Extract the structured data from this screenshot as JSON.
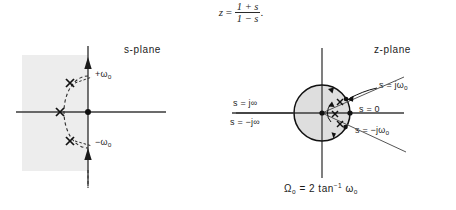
{
  "figure": {
    "title_equation": {
      "lhs": "z",
      "eq": "=",
      "numerator": "1 + s",
      "denominator": "1 − s",
      "period": "."
    },
    "left_panel": {
      "name": "s-plane",
      "label": "s-plane",
      "axes": {
        "horizontal": "real axis",
        "vertical": "imaginary axis"
      },
      "shaded_region": "left half plane",
      "shade_color": "#ececec",
      "origin_marker": "filled-dot",
      "poles": [
        {
          "marker": "x",
          "label": "+ω₀"
        },
        {
          "marker": "x",
          "label": ""
        },
        {
          "marker": "x",
          "label": "−ω₀"
        }
      ],
      "annotations": [
        {
          "text_main": "+ω",
          "text_sub": "o"
        },
        {
          "text_main": "−ω",
          "text_sub": "o"
        }
      ],
      "dashed_arc": "semicircle through poles"
    },
    "right_panel": {
      "name": "z-plane",
      "label": "z-plane",
      "unit_circle": "shaded unit disk",
      "shade_color": "#dcdcdc",
      "angle_label_main": "Ω",
      "angle_label_sub": "o",
      "labels": [
        {
          "id": "s-j-infinity",
          "text": "s = j∞"
        },
        {
          "id": "s-minus-j-infinity",
          "text": "s = −j∞"
        },
        {
          "id": "s-zero",
          "text": "s = 0"
        },
        {
          "id": "s-j-omega-zero",
          "text_main": "s = jω",
          "text_sub": "o"
        },
        {
          "id": "s-minus-j-omega-zero",
          "text_main": "s = −jω",
          "text_sub": "o"
        }
      ],
      "markers": [
        "x",
        "x",
        "x"
      ],
      "origin_marker": "filled-dot",
      "point_s0_marker": "filled-dot"
    },
    "bottom_equation": {
      "lhs_main": "Ω",
      "lhs_sub": "o",
      "eq": "=",
      "coef": "2",
      "fn": "tan",
      "exp": "−1",
      "arg_main": "ω",
      "arg_sub": "o"
    }
  }
}
